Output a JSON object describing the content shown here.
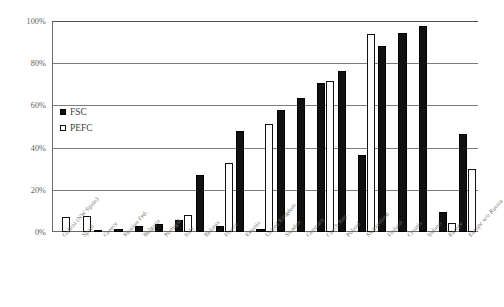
{
  "chart_data": {
    "type": "bar",
    "title": "",
    "xlabel": "",
    "ylabel": "",
    "ylim": [
      0,
      100
    ],
    "ytick_labels": [
      "0%",
      "20%",
      "40%",
      "60%",
      "80%",
      "100%"
    ],
    "ytick_values": [
      0,
      20,
      40,
      60,
      80,
      100
    ],
    "grid": true,
    "legend_position": "inside-upper-left",
    "categories": [
      "Galicia (NW Spain)",
      "Spain",
      "Greece",
      "Russian Fed.",
      "Bulgaria",
      "Portugal",
      "Italy",
      "Belarus",
      "France",
      "Estonia",
      "United Kingdom",
      "Sweden",
      "Germany",
      "Czech Rep.",
      "Poland",
      "Switzerland",
      "Finland",
      "Croatia",
      "Ireland",
      "Europe",
      "Europe w/o Russia"
    ],
    "italic_categories": [
      "Europe",
      "Europe w/o Russia"
    ],
    "series": [
      {
        "name": "FSC",
        "color": "#111111",
        "values": [
          0,
          0,
          0.8,
          1.2,
          3,
          4,
          5.5,
          27,
          3,
          48,
          1.5,
          58,
          63.5,
          70.5,
          76.5,
          36.5,
          88,
          94.5,
          97.5,
          9.5,
          46.5
        ]
      },
      {
        "name": "PEFC",
        "color": "#ffffff",
        "values": [
          7,
          7.5,
          0,
          0,
          0,
          0,
          8,
          0,
          32.5,
          0,
          51,
          0,
          0,
          71.5,
          0,
          94,
          0,
          0,
          0,
          4.5,
          30
        ]
      }
    ]
  },
  "legend": {
    "items": [
      {
        "label": "FSC"
      },
      {
        "label": "PEFC"
      }
    ]
  }
}
